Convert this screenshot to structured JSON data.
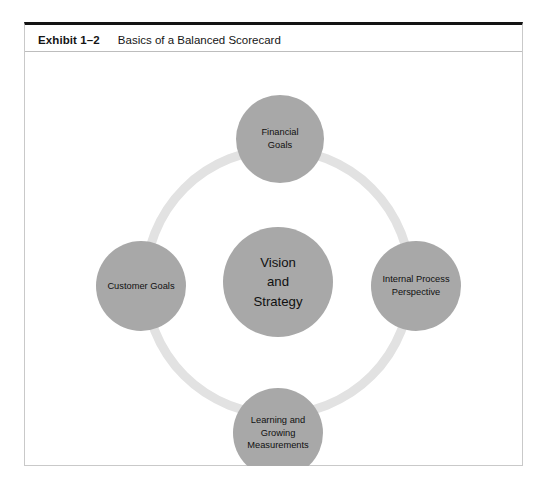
{
  "exhibit": {
    "number": "Exhibit 1–2",
    "title": "Basics of a Balanced Scorecard"
  },
  "colors": {
    "node_fill": "#a8a8a8",
    "ring_stroke": "#e2e2e2",
    "frame_top_border": "#131313",
    "frame_border": "#c9c9c9",
    "text": "#101010",
    "background": "#ffffff"
  },
  "diagram": {
    "type": "balanced-scorecard",
    "ring": {
      "center_x": 253,
      "center_y": 229,
      "radius": 137,
      "thickness": 9
    },
    "nodes": [
      {
        "id": "center",
        "name": "vision-and-strategy",
        "label": "Vision\nand\nStrategy",
        "cx": 253,
        "cy": 229,
        "r": 55
      },
      {
        "id": "top",
        "name": "financial-goals",
        "label": "Financial\nGoals",
        "cx": 255,
        "cy": 86,
        "r": 44
      },
      {
        "id": "left",
        "name": "customer-goals",
        "label": "Customer Goals",
        "cx": 116,
        "cy": 233,
        "r": 45
      },
      {
        "id": "right",
        "name": "internal-process-perspective",
        "label": "Internal Process\nPerspective",
        "cx": 391,
        "cy": 233,
        "r": 45
      },
      {
        "id": "bottom",
        "name": "learning-and-growing-measurements",
        "label": "Learning and\nGrowing\nMeasurements",
        "cx": 253,
        "cy": 380,
        "r": 45
      }
    ]
  }
}
